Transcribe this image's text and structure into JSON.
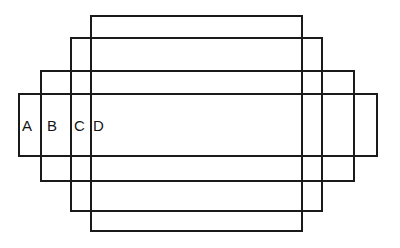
{
  "figure": {
    "background_color": "#ffffff",
    "stroke_color": "#1a1a1a",
    "stroke_width_px": 2,
    "canvas": {
      "width": 400,
      "height": 248
    },
    "label_color": "#141414",
    "label_font_size_px": 15
  },
  "rectangles": [
    {
      "id": "A",
      "label": "A",
      "x": 18,
      "y": 93,
      "width": 360,
      "height": 64,
      "label_x": 22,
      "label_y": 118
    },
    {
      "id": "B",
      "label": "B",
      "x": 40,
      "y": 70,
      "width": 315,
      "height": 112,
      "label_x": 47,
      "label_y": 118
    },
    {
      "id": "C",
      "label": "C",
      "x": 70,
      "y": 37,
      "width": 253,
      "height": 175,
      "label_x": 74,
      "label_y": 118
    },
    {
      "id": "D",
      "label": "D",
      "x": 90,
      "y": 15,
      "width": 213,
      "height": 217,
      "label_x": 93,
      "label_y": 118
    }
  ]
}
